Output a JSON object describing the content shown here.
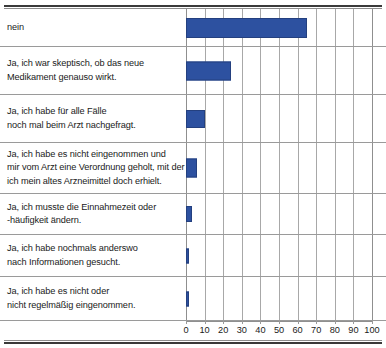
{
  "chart_data": {
    "type": "bar",
    "orientation": "horizontal",
    "title": "",
    "xlabel": "",
    "ylabel": "",
    "xlim": [
      0,
      100
    ],
    "xticks": [
      0,
      10,
      20,
      30,
      40,
      50,
      60,
      70,
      80,
      90,
      100
    ],
    "grid": "vertical",
    "legend": "none",
    "bar_color": "#2d51a0",
    "categories": [
      "nein",
      "Ja, ich war skeptisch, ob das neue Medikament genauso wirkt.",
      "Ja, ich habe für alle Fälle noch mal beim Arzt nachgefragt.",
      "Ja, ich habe es nicht eingenommen und mir vom Arzt eine Verordnung geholt, mit der ich mein altes Arzneimittel doch erhielt.",
      "Ja, ich musste die Einnahmezeit oder -häufigkeit ändern.",
      "Ja, ich habe nochmals anderswo nach Informationen gesucht.",
      "Ja, ich habe es nicht oder nicht regelmäßig eingenommen."
    ],
    "category_lines": [
      [
        "nein"
      ],
      [
        "Ja, ich war skeptisch, ob das neue",
        "Medikament genauso wirkt."
      ],
      [
        "Ja, ich habe für alle Fälle",
        "noch mal beim Arzt nachgefragt."
      ],
      [
        "Ja, ich habe es nicht eingenommen und",
        "mir vom Arzt eine Verordnung geholt, mit der",
        "ich mein altes Arzneimittel doch erhielt."
      ],
      [
        "Ja, ich musste die Einnahmezeit oder",
        "-häufigkeit ändern."
      ],
      [
        "Ja, ich habe nochmals anderswo",
        "nach Informationen gesucht."
      ],
      [
        "Ja, ich habe es nicht oder",
        "nicht regelmäßig eingenommen."
      ]
    ],
    "values": [
      65,
      24,
      10,
      6,
      3,
      1,
      1
    ]
  }
}
